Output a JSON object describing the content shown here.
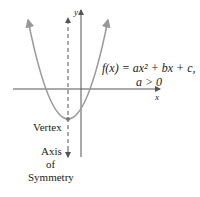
{
  "diagram": {
    "equation_line1": "f(x) = ax² + bx + c,",
    "condition": "a > 0",
    "y_axis_label": "y",
    "x_axis_label": "x",
    "vertex_label": "Vertex",
    "axis_label_line1": "Axis",
    "axis_label_line2": "of",
    "axis_label_line3": "Symmetry",
    "colors": {
      "parabola": "#9a9a9a",
      "axes": "#555555",
      "text": "#222222"
    }
  }
}
